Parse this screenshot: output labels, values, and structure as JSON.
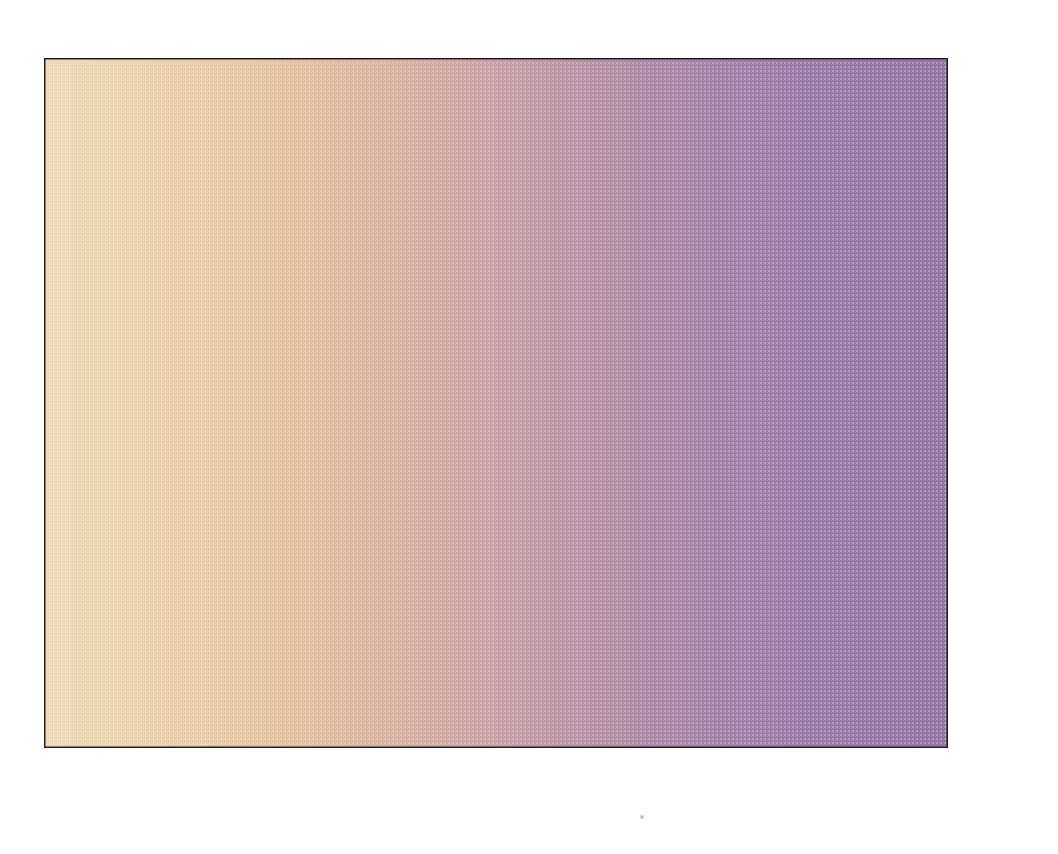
{
  "chart_data": {
    "type": "line",
    "title": "",
    "subtitle": "",
    "xlabel": "Value Score",
    "ylabel": "",
    "xlim": [
      -1,
      41
    ],
    "ylim": [
      0,
      100
    ],
    "grid": true,
    "legend": null,
    "x_ticks": [
      "0",
      "10",
      "20",
      "30",
      "40"
    ],
    "x_tick_values": [
      0,
      10,
      20,
      30,
      40
    ],
    "y_ticks": [
      "0%",
      "10%",
      "20%",
      "30%",
      "40%",
      "50%",
      "60%",
      "70%",
      "80%",
      "90%",
      "100%"
    ],
    "y_tick_values": [
      0,
      10,
      20,
      30,
      40,
      50,
      60,
      70,
      80,
      90,
      100
    ],
    "series": [
      {
        "name": "Cumulative percent",
        "style": "thick-white-band",
        "x": [
          -1,
          0,
          1,
          2,
          3,
          4,
          5,
          6,
          7,
          8,
          9,
          10,
          11,
          12,
          13,
          14,
          15,
          16,
          17,
          18,
          19,
          20,
          21,
          22,
          23,
          24,
          25,
          26,
          27,
          28,
          29,
          30,
          31,
          32,
          33,
          34,
          35,
          36,
          37,
          38,
          39,
          40,
          41
        ],
        "values": [
          5.5,
          5.2,
          5.1,
          5.3,
          5.5,
          5.8,
          6.2,
          6.6,
          7.0,
          7.4,
          7.8,
          8.2,
          8.7,
          9.6,
          9.4,
          9.9,
          10.8,
          11.8,
          12.8,
          13.8,
          15.0,
          16.5,
          17.8,
          19.4,
          21.2,
          23.2,
          25.4,
          28.6,
          29.2,
          31.4,
          33.8,
          36.6,
          39.6,
          42.6,
          46.5,
          51.6,
          53.6,
          56.8,
          60.6,
          63.8,
          68.4,
          72.2,
          82.0
        ]
      }
    ],
    "annotations": []
  },
  "axes": {
    "x_title": "Value Score",
    "x_tick_labels": [
      "0",
      "10",
      "20",
      "30",
      "40"
    ],
    "y_tick_labels": [
      "100%",
      "90%",
      "80%",
      "70%",
      "60%",
      "50%",
      "40%",
      "30%",
      "20%",
      "10%",
      "0%"
    ]
  },
  "colors": {
    "gradient_left": "#f7e2bd",
    "gradient_mid": "#d6a8a8",
    "gradient_right": "#9676aa",
    "curve": "#ffffff",
    "gridline": "#241c22",
    "text": "#231f20",
    "background": "#ffffff"
  }
}
